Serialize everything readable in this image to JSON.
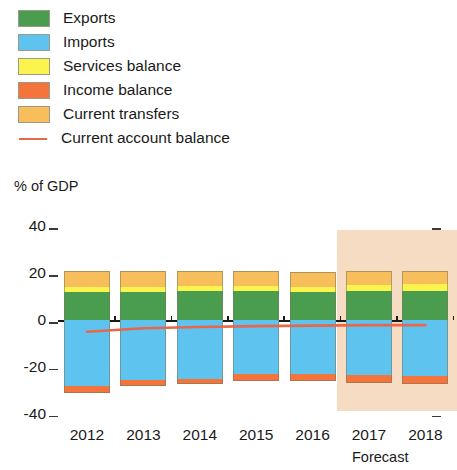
{
  "legend": {
    "items": [
      {
        "label": "Exports",
        "color": "#4a9c4e",
        "kind": "swatch"
      },
      {
        "label": "Imports",
        "color": "#5ec3ee",
        "kind": "swatch"
      },
      {
        "label": "Services balance",
        "color": "#fbf44e",
        "kind": "swatch"
      },
      {
        "label": "Income balance",
        "color": "#f4743b",
        "kind": "swatch"
      },
      {
        "label": "Current transfers",
        "color": "#f8be5c",
        "kind": "swatch"
      },
      {
        "label": "Current account balance",
        "color": "#e8664a",
        "kind": "line"
      }
    ]
  },
  "chart_data": {
    "type": "bar",
    "stacked": true,
    "title": "",
    "subtitle": "",
    "xlabel": "",
    "ylabel": "% of GDP",
    "ylim": [
      -40,
      40
    ],
    "yticks": [
      40,
      20,
      0,
      -20,
      -40
    ],
    "ytick_labels": [
      "40",
      "20",
      "0",
      "-20",
      "-40"
    ],
    "grid": false,
    "legend_position": "top-left",
    "categories": [
      "2012",
      "2013",
      "2014",
      "2015",
      "2016",
      "2017",
      "2018"
    ],
    "forecast_categories": [
      "2017",
      "2018"
    ],
    "forecast_label": "Forecast",
    "forecast_band_color": "#f7dcc4",
    "series": [
      {
        "name": "Exports",
        "color": "#4a9c4e",
        "values": [
          12.0,
          12.0,
          12.5,
          12.3,
          12.0,
          12.3,
          12.3
        ]
      },
      {
        "name": "Services balance",
        "color": "#fbf44e",
        "values": [
          2.0,
          2.0,
          2.0,
          2.2,
          2.2,
          2.6,
          3.0
        ]
      },
      {
        "name": "Current transfers",
        "color": "#f8be5c",
        "values": [
          7.0,
          6.8,
          6.6,
          6.3,
          6.2,
          6.0,
          5.8
        ]
      },
      {
        "name": "Imports",
        "color": "#5ec3ee",
        "values": [
          -28.0,
          -25.5,
          -25.0,
          -23.0,
          -23.0,
          -23.5,
          -24.0
        ]
      },
      {
        "name": "Income balance",
        "color": "#f4743b",
        "values": [
          -3.0,
          -2.5,
          -2.5,
          -3.0,
          -3.0,
          -3.5,
          -3.5
        ]
      }
    ],
    "line_series": {
      "name": "Current account balance",
      "color": "#e8664a",
      "x": [
        "2012",
        "2013",
        "2014",
        "2015",
        "2016",
        "2017",
        "2018"
      ],
      "values": [
        -5.0,
        -3.5,
        -3.0,
        -2.6,
        -2.4,
        -2.2,
        -2.2
      ]
    }
  }
}
